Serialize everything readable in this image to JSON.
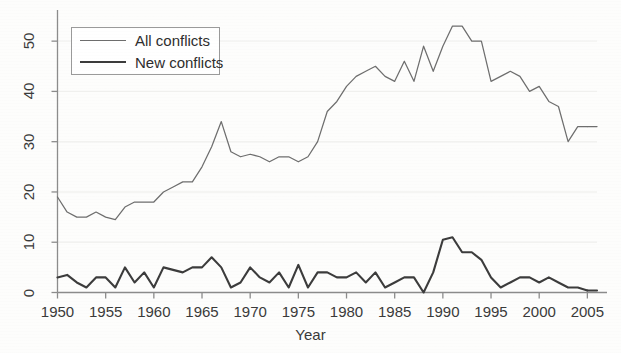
{
  "chart_data": {
    "type": "line",
    "title": "",
    "xlabel": "Year",
    "ylabel": "",
    "xlim": [
      1950,
      2006
    ],
    "ylim": [
      0,
      55
    ],
    "grid": true,
    "grid_levels": [
      10,
      20,
      30,
      40,
      50
    ],
    "legend_position": "upper left",
    "xticks": [
      1950,
      1955,
      1960,
      1965,
      1970,
      1975,
      1980,
      1985,
      1990,
      1995,
      2000,
      2005
    ],
    "xtick_labels": [
      "1950",
      "1955",
      "1960",
      "1965",
      "1970",
      "1975",
      "1980",
      "1985",
      "1990",
      "1995",
      "2000",
      "2005"
    ],
    "yticks": [
      0,
      10,
      20,
      30,
      40,
      50
    ],
    "ytick_labels": [
      "0",
      "10",
      "20",
      "30",
      "40",
      "50"
    ],
    "x": [
      1950,
      1951,
      1952,
      1953,
      1954,
      1955,
      1956,
      1957,
      1958,
      1959,
      1960,
      1961,
      1962,
      1963,
      1964,
      1965,
      1966,
      1967,
      1968,
      1969,
      1970,
      1971,
      1972,
      1973,
      1974,
      1975,
      1976,
      1977,
      1978,
      1979,
      1980,
      1981,
      1982,
      1983,
      1984,
      1985,
      1986,
      1987,
      1988,
      1989,
      1990,
      1991,
      1992,
      1993,
      1994,
      1995,
      1996,
      1997,
      1998,
      1999,
      2000,
      2001,
      2002,
      2003,
      2004,
      2005
    ],
    "series": [
      {
        "name": "All conflicts",
        "style": "thin",
        "color": "#6e6e6e",
        "values": [
          19,
          16,
          15,
          15,
          16,
          15,
          14.5,
          17,
          18,
          18,
          18,
          20,
          21,
          22,
          22,
          25,
          29,
          34,
          28,
          27,
          27.5,
          27,
          26,
          27,
          27,
          26,
          27,
          30,
          36,
          38,
          41,
          43,
          44,
          45,
          43,
          42,
          46,
          42,
          49,
          44,
          49,
          53,
          53,
          50,
          50,
          42,
          43,
          44,
          43,
          40,
          41,
          38,
          37,
          30,
          33,
          33
        ]
      },
      {
        "name": "New conflicts",
        "style": "thick",
        "color": "#3c3c3c",
        "values": [
          3,
          3.5,
          2,
          1,
          3,
          3,
          1,
          5,
          2,
          4,
          1,
          5,
          4.5,
          4,
          5,
          5,
          7,
          5,
          1,
          2,
          5,
          3,
          2,
          4,
          1,
          5.5,
          1,
          4,
          4,
          3,
          3,
          4,
          2,
          4,
          1,
          2,
          3,
          3,
          0,
          4,
          10.5,
          11,
          8,
          8,
          6.5,
          3,
          1,
          2,
          3,
          3,
          2,
          3,
          2,
          1,
          1,
          0.4
        ]
      }
    ]
  },
  "axes": {
    "x_title": "Year"
  },
  "legend": {
    "entries": [
      {
        "label": "All conflicts"
      },
      {
        "label": "New conflicts"
      }
    ]
  }
}
